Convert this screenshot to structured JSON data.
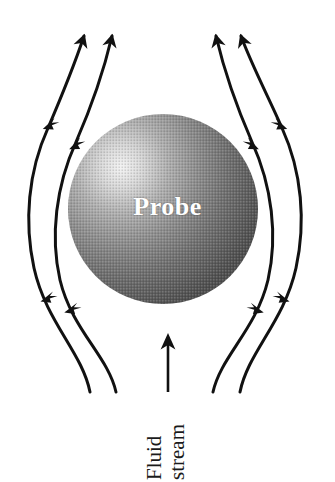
{
  "figure": {
    "type": "flow-diagram",
    "title": "",
    "background_color": "#ffffff",
    "width": 335,
    "height": 482
  },
  "sphere": {
    "label": "Probe",
    "label_color": "#ffffff",
    "center_x": 163,
    "center_y": 209,
    "radius": 95,
    "highlight_color": "#efefef",
    "mid_color": "#7a7a7a",
    "edge_color": "#4a4a4a",
    "highlight_x": 120,
    "highlight_y": 162
  },
  "caption": {
    "line1": "Fluid",
    "line2": "stream",
    "rotation_degrees": -90,
    "color": "#1a1a1a"
  },
  "inlet_arrow": {
    "name": "fluid-stream-direction-arrow",
    "x": 168,
    "y_tail": 392,
    "y_head": 336,
    "color": "#111111"
  },
  "streamlines": {
    "stroke_color": "#111111",
    "stroke_width": 3,
    "count": 4,
    "arrowheads_per_line": 3,
    "items": [
      {
        "name": "streamline-left-outer",
        "side": "left",
        "start_x": 90,
        "start_y": 392,
        "end_x": 84,
        "end_y": 32
      },
      {
        "name": "streamline-left-inner",
        "side": "left",
        "start_x": 116,
        "start_y": 392,
        "end_x": 112,
        "end_y": 32
      },
      {
        "name": "streamline-right-inner",
        "side": "right",
        "start_x": 213,
        "start_y": 392,
        "end_x": 216,
        "end_y": 32
      },
      {
        "name": "streamline-right-outer",
        "side": "right",
        "start_x": 240,
        "start_y": 392,
        "end_x": 241,
        "end_y": 32
      }
    ]
  }
}
